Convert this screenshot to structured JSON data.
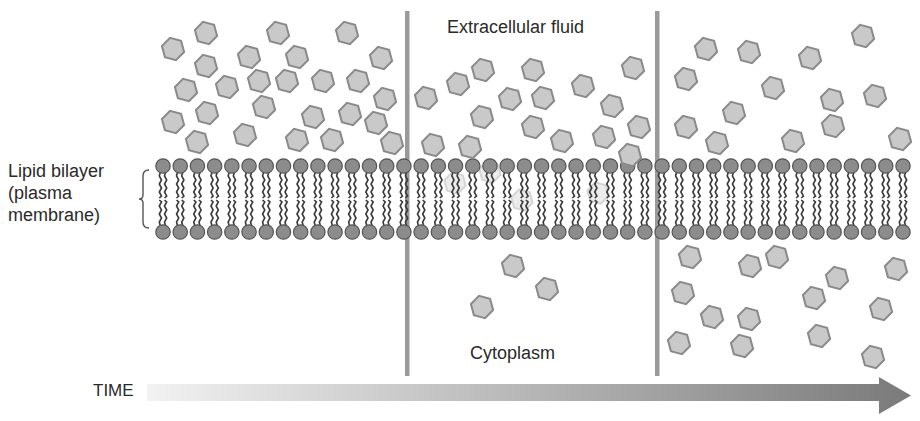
{
  "labels": {
    "membrane_lines": [
      "Lipid bilayer",
      "(plasma",
      "membrane)"
    ],
    "extracellular": "Extracellular fluid",
    "cytoplasm": "Cytoplasm",
    "time": "TIME"
  },
  "colors": {
    "hex_fill": "#c9c9c9",
    "hex_stroke": "#8a8a8a",
    "head_fill": "#8c8c8c",
    "head_stroke": "#555555",
    "tail": "#3a3a3a",
    "divider": "#9a9a9a",
    "arrow_start": "#f2f2f2",
    "arrow_end": "#7a7a7a",
    "text": "#2a2a2a"
  },
  "membrane": {
    "x_start": 163,
    "x_end": 903,
    "count": 44,
    "top_y": 166,
    "bottom_y": 232,
    "head_r": 7.2
  },
  "dividers": [
    {
      "x": 407,
      "y1": 11,
      "y2": 376
    },
    {
      "x": 657,
      "y1": 11,
      "y2": 376
    }
  ],
  "molecules": {
    "panel_1_extracellular": [
      [
        173,
        49
      ],
      [
        206,
        33
      ],
      [
        278,
        33
      ],
      [
        347,
        33
      ],
      [
        249,
        57
      ],
      [
        297,
        57
      ],
      [
        381,
        58
      ],
      [
        206,
        66
      ],
      [
        186,
        90
      ],
      [
        227,
        87
      ],
      [
        259,
        81
      ],
      [
        287,
        81
      ],
      [
        323,
        81
      ],
      [
        358,
        81
      ],
      [
        385,
        99
      ],
      [
        264,
        107
      ],
      [
        207,
        113
      ],
      [
        173,
        122
      ],
      [
        313,
        117
      ],
      [
        350,
        114
      ],
      [
        376,
        123
      ],
      [
        197,
        142
      ],
      [
        245,
        135
      ],
      [
        297,
        140
      ],
      [
        332,
        140
      ],
      [
        392,
        143
      ]
    ],
    "panel_2_extracellular": [
      [
        426,
        98
      ],
      [
        458,
        84
      ],
      [
        483,
        70
      ],
      [
        533,
        70
      ],
      [
        510,
        99
      ],
      [
        543,
        98
      ],
      [
        482,
        117
      ],
      [
        583,
        86
      ],
      [
        633,
        68
      ],
      [
        612,
        106
      ],
      [
        639,
        127
      ],
      [
        533,
        127
      ],
      [
        562,
        141
      ],
      [
        604,
        137
      ],
      [
        433,
        145
      ],
      [
        470,
        147
      ],
      [
        630,
        155
      ]
    ],
    "panel_2_in_membrane": [
      [
        455,
        183
      ],
      [
        490,
        172
      ],
      [
        522,
        200
      ],
      [
        598,
        193
      ]
    ],
    "panel_2_cytoplasm": [
      [
        513,
        266
      ],
      [
        547,
        289
      ],
      [
        482,
        307
      ]
    ],
    "panel_3_extracellular": [
      [
        706,
        49
      ],
      [
        749,
        52
      ],
      [
        810,
        58
      ],
      [
        863,
        36
      ],
      [
        686,
        79
      ],
      [
        773,
        88
      ],
      [
        832,
        100
      ],
      [
        875,
        96
      ],
      [
        734,
        113
      ],
      [
        686,
        127
      ],
      [
        833,
        126
      ],
      [
        717,
        143
      ],
      [
        793,
        141
      ],
      [
        900,
        139
      ]
    ],
    "panel_3_cytoplasm": [
      [
        690,
        257
      ],
      [
        750,
        266
      ],
      [
        777,
        257
      ],
      [
        837,
        278
      ],
      [
        896,
        269
      ],
      [
        683,
        293
      ],
      [
        814,
        298
      ],
      [
        712,
        317
      ],
      [
        749,
        319
      ],
      [
        881,
        309
      ],
      [
        679,
        343
      ],
      [
        742,
        346
      ],
      [
        819,
        336
      ],
      [
        873,
        357
      ]
    ]
  },
  "time_arrow": {
    "x_start": 147,
    "body_top": 384,
    "body_bottom": 401,
    "head_x": 879,
    "head_top": 377,
    "head_bottom": 414,
    "tip_x": 911
  }
}
